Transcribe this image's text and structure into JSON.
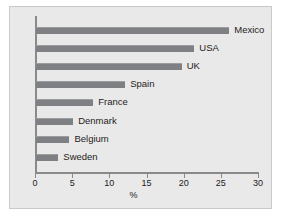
{
  "chart_data": {
    "type": "bar",
    "orientation": "horizontal",
    "title": "",
    "xlabel": "%",
    "ylabel": "",
    "xlim": [
      0,
      30
    ],
    "xticks": [
      0,
      5,
      10,
      15,
      20,
      25,
      30
    ],
    "xtick_labels": [
      "0",
      "5",
      "10",
      "15",
      "20",
      "25",
      "30"
    ],
    "grid": false,
    "legend": null,
    "categories": [
      "Mexico",
      "USA",
      "UK",
      "Spain",
      "France",
      "Denmark",
      "Belgium",
      "Sweden"
    ],
    "values": [
      26,
      21.3,
      19.6,
      12,
      7.7,
      5,
      4.5,
      3
    ],
    "bar_color": "#7e8083",
    "panel_color": "#e9e9e9",
    "axis_color": "#8a8a8a",
    "text_color": "#23201e"
  }
}
